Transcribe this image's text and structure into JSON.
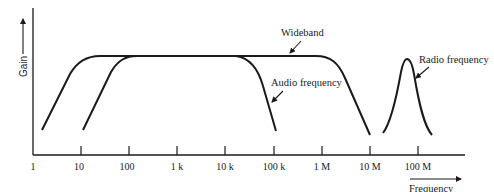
{
  "diagram": {
    "type": "frequency-response",
    "y_axis": {
      "label": "Gain"
    },
    "x_axis": {
      "label": "Frequency",
      "scale": "log",
      "ticks": [
        "1",
        "10",
        "100",
        "1 k",
        "10 k",
        "100 k",
        "1 M",
        "10 M",
        "100 M"
      ]
    },
    "curves": [
      {
        "name": "Wideband",
        "label": "Wideband",
        "approx_range": "≈3 Hz – 10 MHz"
      },
      {
        "name": "Audio frequency",
        "label": "Audio frequency",
        "approx_range": "≈12 Hz – 100 kHz"
      },
      {
        "name": "Radio frequency",
        "label": "Radio frequency",
        "approx_peak": "≈60 MHz"
      }
    ],
    "colors": {
      "stroke": "#1a1a1a",
      "background": "#ffffff"
    }
  }
}
